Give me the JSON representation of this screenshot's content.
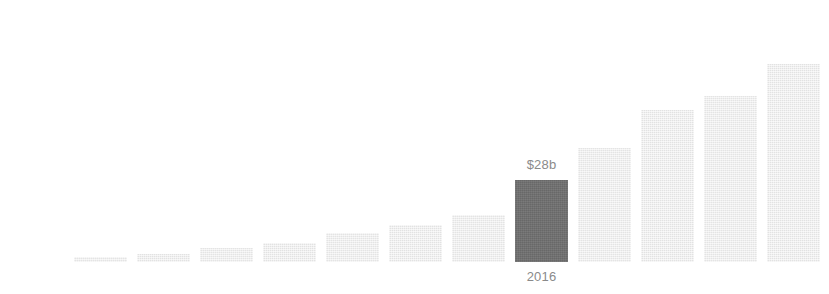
{
  "chart_data": {
    "type": "bar",
    "title": "",
    "subtitle": "",
    "xlabel": "",
    "ylabel": "",
    "grid": false,
    "legend": false,
    "axis_visible": false,
    "categories": [
      "",
      "",
      "",
      "",
      "",
      "",
      "",
      "2016",
      "",
      "",
      "",
      "",
      ""
    ],
    "values": [
      1.7,
      2.7,
      4.8,
      6.5,
      9.9,
      12.6,
      16.0,
      28,
      38.9,
      51.9,
      64.6,
      67.6,
      84.0
    ],
    "value_unit": "$b",
    "ylim": [
      0,
      84
    ],
    "highlight_index": 7,
    "annotations": [
      {
        "index": 7,
        "value_label": "$28b",
        "category_label": "2016",
        "position": "above-and-below-bar"
      }
    ],
    "colors": {
      "bar": "#e9e9e9",
      "bar_highlight": "#6f6f6f",
      "label_text": "#8a8a8a",
      "background": "#ffffff"
    },
    "layout": {
      "canvas_width": 829,
      "canvas_height": 294,
      "baseline_y": 262,
      "first_bar_left": 74,
      "bar_width": 53,
      "bar_pitch": 63,
      "max_bar_top": 16
    },
    "bar_tops_px": [
      257,
      254,
      248,
      243,
      233,
      225,
      215,
      180,
      148,
      110,
      96,
      64,
      16
    ]
  }
}
